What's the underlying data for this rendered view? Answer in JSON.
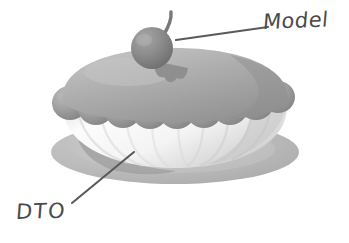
{
  "figure": {
    "background_color": "#ffffff",
    "width": 349,
    "height": 243,
    "style": "hand-drawn grayscale illustration"
  },
  "annotations": [
    {
      "id": "model",
      "label": "Model",
      "target": "cherry-on-top",
      "line_color": "#5a5a5a",
      "text_color": "#4a4a4a"
    },
    {
      "id": "dto",
      "label": "DTO",
      "target": "bowl-base",
      "line_color": "#5a5a5a",
      "text_color": "#4a4a4a"
    }
  ],
  "illustration": {
    "parts": [
      {
        "name": "plate",
        "color": "#b8b8b8",
        "description": "elliptical gray serving plate"
      },
      {
        "name": "bowl",
        "color": "#f2f2f2",
        "description": "white fluted dessert bowl"
      },
      {
        "name": "cream-ring",
        "color": "#9a9a9a",
        "description": "ring of gray cream dollops"
      },
      {
        "name": "dome",
        "color": "#a8a8a8",
        "description": "gray domed topping"
      },
      {
        "name": "cherry",
        "color": "#8a8a8a",
        "description": "gray cherry with stem"
      }
    ]
  },
  "colors": {
    "plate": "#b8b8b8",
    "plate_shadow": "#aaaaaa",
    "bowl_light": "#fbfbfb",
    "bowl_shade": "#d8d8d8",
    "cream": "#9a9a9a",
    "cream_light": "#b4b4b4",
    "dome": "#a8a8a8",
    "dome_light": "#c0c0c0",
    "cherry": "#8a8a8a",
    "cherry_light": "#a2a2a2",
    "stem": "#7a7a7a",
    "ink": "#4a4a4a",
    "leader": "#5a5a5a"
  }
}
